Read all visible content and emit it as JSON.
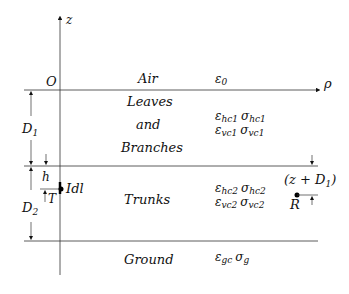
{
  "axes": {
    "vertical_label": "z",
    "horizontal_label": "ρ",
    "origin_label": "O"
  },
  "layers": [
    {
      "name": "Air",
      "params": [
        {
          "sym": "ε",
          "sub": "0"
        }
      ]
    },
    {
      "name_lines": [
        "Leaves",
        "and",
        "Branches"
      ],
      "params": [
        {
          "sym": "ε",
          "sub": "hc1"
        },
        {
          "sym": "σ",
          "sub": "hc1"
        },
        {
          "sym": "ε",
          "sub": "vc1"
        },
        {
          "sym": "σ",
          "sub": "vc1"
        }
      ]
    },
    {
      "name": "Trunks",
      "params": [
        {
          "sym": "ε",
          "sub": "hc2"
        },
        {
          "sym": "σ",
          "sub": "hc2"
        },
        {
          "sym": "ε",
          "sub": "vc2"
        },
        {
          "sym": "σ",
          "sub": "vc2"
        }
      ]
    },
    {
      "name": "Ground",
      "params": [
        {
          "sym": "ε",
          "sub": "gc"
        },
        {
          "sym": "σ",
          "sub": "g"
        }
      ]
    }
  ],
  "labels": {
    "air": "Air",
    "leaves": "Leaves",
    "and": "and",
    "branches": "Branches",
    "trunks": "Trunks",
    "ground": "Ground",
    "eps": "ε",
    "sig": "σ",
    "eps0_sub": "0",
    "hc1": "hc1",
    "vc1": "vc1",
    "hc2": "hc2",
    "vc2": "vc2",
    "gc": "gc",
    "g": "g",
    "D1": "D",
    "D1_sub": "1",
    "D2": "D",
    "D2_sub": "2",
    "h": "h",
    "T": "T",
    "source": "Idl",
    "receiver": "R",
    "receiver_height_open": "(z + D",
    "receiver_height_sub": "1",
    "receiver_height_close": ")"
  }
}
